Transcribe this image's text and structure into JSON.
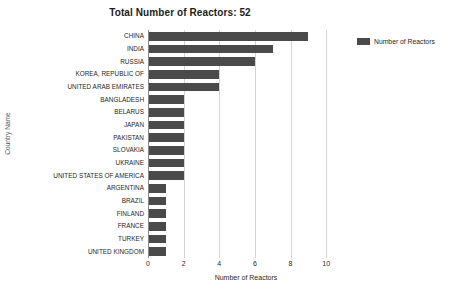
{
  "chart_data": {
    "type": "bar",
    "orientation": "horizontal",
    "title": "Total Number of Reactors: 52",
    "xlabel": "Number of Reactors",
    "ylabel": "Country Name",
    "xlim": [
      0,
      11
    ],
    "xticks": [
      "0",
      "2",
      "4",
      "6",
      "8",
      "10"
    ],
    "xtick_values": [
      0,
      2,
      4,
      6,
      8,
      10
    ],
    "grid": "vertical",
    "legend_position": "right",
    "bar_color": "#4a4a4a",
    "gridline_color": "#d3d3d3",
    "categories": [
      "CHINA",
      "INDIA",
      "RUSSIA",
      "KOREA, REPUBLIC OF",
      "UNITED ARAB EMIRATES",
      "BANGLADESH",
      "BELARUS",
      "JAPAN",
      "PAKISTAN",
      "SLOVAKIA",
      "UKRAINE",
      "UNITED STATES OF AMERICA",
      "ARGENTINA",
      "BRAZIL",
      "FINLAND",
      "FRANCE",
      "TURKEY",
      "UNITED KINGDOM"
    ],
    "values": [
      9,
      7,
      6,
      4,
      4,
      2,
      2,
      2,
      2,
      2,
      2,
      2,
      1,
      1,
      1,
      1,
      1,
      1
    ],
    "series": [
      {
        "name": "Number of Reactors",
        "values": [
          9,
          7,
          6,
          4,
          4,
          2,
          2,
          2,
          2,
          2,
          2,
          2,
          1,
          1,
          1,
          1,
          1,
          1
        ]
      }
    ]
  },
  "legend": {
    "entries": [
      {
        "label": "Number of Reactors",
        "color": "#4a4a4a"
      }
    ]
  }
}
